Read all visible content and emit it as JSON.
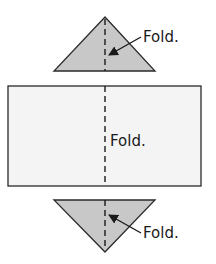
{
  "diagram": {
    "colors": {
      "triangle_fill": "#c8c8c8",
      "rectangle_fill": "#f4f4f4",
      "stroke": "#2a2a2a",
      "text": "#1a1a1a"
    },
    "top_triangle": {
      "label": "Fold."
    },
    "rectangle": {
      "label": "Fold."
    },
    "bottom_triangle": {
      "label": "Fold."
    }
  }
}
